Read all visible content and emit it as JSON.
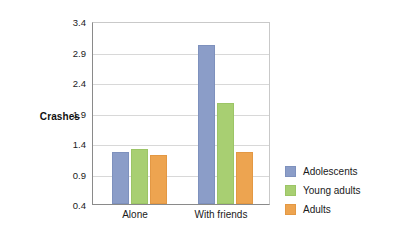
{
  "chart_data": {
    "type": "bar",
    "title": "",
    "subtitle": "",
    "xlabel": "",
    "ylabel": "Crashes",
    "categories": [
      "Alone",
      "With friends"
    ],
    "series": [
      {
        "name": "Adolescents",
        "color": "#8b9dc8",
        "values": [
          1.25,
          3.0
        ]
      },
      {
        "name": "Young adults",
        "color": "#a8cf72",
        "values": [
          1.3,
          2.05
        ]
      },
      {
        "name": "Adults",
        "color": "#eda450",
        "values": [
          1.2,
          1.25
        ]
      }
    ],
    "ylim": [
      0.4,
      3.4
    ],
    "yticks": [
      "0.4",
      "0.9",
      "1.4",
      "1.9",
      "2.4",
      "2.9",
      "3.4"
    ],
    "ytick_values": [
      0.4,
      0.9,
      1.4,
      1.9,
      2.4,
      2.9,
      3.4
    ],
    "grid": "horizontal",
    "legend_position": "right"
  },
  "axis": {
    "y_title": "Crashes",
    "y_ticks": [
      "3.4",
      "2.9",
      "2.4",
      "1.9",
      "1.4",
      "0.9",
      "0.4"
    ],
    "x_ticks": [
      "Alone",
      "With friends"
    ]
  },
  "legend": {
    "items": [
      {
        "label": "Adolescents",
        "color": "#8b9dc8"
      },
      {
        "label": "Young adults",
        "color": "#a8cf72"
      },
      {
        "label": "Adults",
        "color": "#eda450"
      }
    ]
  }
}
